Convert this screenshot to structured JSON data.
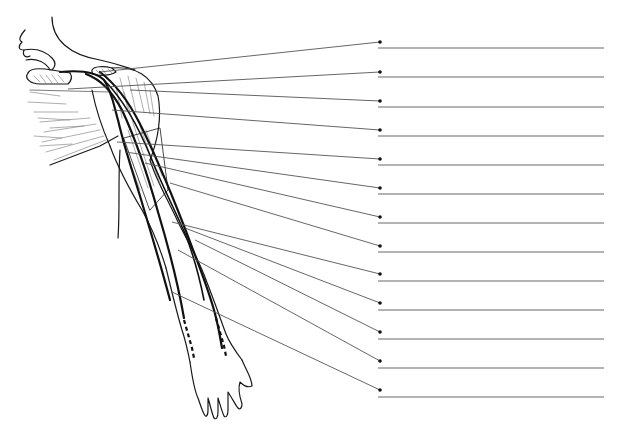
{
  "diagram": {
    "type": "anatomical-labeling-worksheet",
    "colors": {
      "ink": "#111111",
      "leader": "#555555",
      "label_line": "#9a9a9a",
      "background": "#ffffff"
    },
    "label_line_x_start": 378,
    "label_line_x_end": 604,
    "dot_x": 380,
    "labels": [
      {
        "index": 1,
        "text": "",
        "origin": [
          100,
          72
        ],
        "dot_y": 42,
        "line_y": 48
      },
      {
        "index": 2,
        "text": "",
        "origin": [
          68,
          89
        ],
        "dot_y": 72,
        "line_y": 77
      },
      {
        "index": 3,
        "text": "",
        "origin": [
          130,
          90
        ],
        "dot_y": 101,
        "line_y": 107
      },
      {
        "index": 4,
        "text": "",
        "origin": [
          112,
          110
        ],
        "dot_y": 130,
        "line_y": 136
      },
      {
        "index": 5,
        "text": "",
        "origin": [
          117,
          142
        ],
        "dot_y": 159,
        "line_y": 165
      },
      {
        "index": 6,
        "text": "",
        "origin": [
          125,
          152
        ],
        "dot_y": 188,
        "line_y": 194
      },
      {
        "index": 7,
        "text": "",
        "origin": [
          145,
          163
        ],
        "dot_y": 217,
        "line_y": 223
      },
      {
        "index": 8,
        "text": "",
        "origin": [
          170,
          183
        ],
        "dot_y": 246,
        "line_y": 252
      },
      {
        "index": 9,
        "text": "",
        "origin": [
          172,
          222
        ],
        "dot_y": 274,
        "line_y": 281
      },
      {
        "index": 10,
        "text": "",
        "origin": [
          185,
          228
        ],
        "dot_y": 303,
        "line_y": 310
      },
      {
        "index": 11,
        "text": "",
        "origin": [
          195,
          240
        ],
        "dot_y": 332,
        "line_y": 339
      },
      {
        "index": 12,
        "text": "",
        "origin": [
          178,
          250
        ],
        "dot_y": 361,
        "line_y": 368
      },
      {
        "index": 13,
        "text": "",
        "origin": [
          172,
          292
        ],
        "dot_y": 390,
        "line_y": 397
      }
    ]
  }
}
